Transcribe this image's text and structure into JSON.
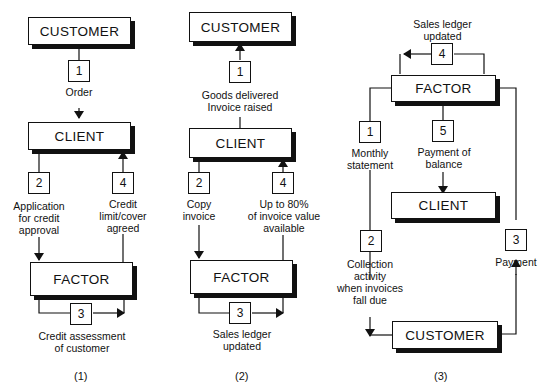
{
  "diagrams": [
    {
      "caption": "(1)",
      "entities": {
        "top": "CUSTOMER",
        "middle": "CLIENT",
        "bottom": "FACTOR"
      },
      "steps": [
        {
          "num": "1",
          "text": [
            "Order"
          ]
        },
        {
          "num": "2",
          "text": [
            "Application",
            "for credit",
            "approval"
          ]
        },
        {
          "num": "3",
          "text": [
            "Credit assessment",
            "of customer"
          ]
        },
        {
          "num": "4",
          "text": [
            "Credit",
            "limit/cover",
            "agreed"
          ]
        }
      ]
    },
    {
      "caption": "(2)",
      "entities": {
        "top": "CUSTOMER",
        "middle": "CLIENT",
        "bottom": "FACTOR"
      },
      "steps": [
        {
          "num": "1",
          "text": [
            "Goods delivered",
            "Invoice raised"
          ]
        },
        {
          "num": "2",
          "text": [
            "Copy",
            "invoice"
          ]
        },
        {
          "num": "3",
          "text": [
            "Sales ledger",
            "updated"
          ]
        },
        {
          "num": "4",
          "text": [
            "Up to 80%",
            "of invoice value",
            "available"
          ]
        }
      ]
    },
    {
      "caption": "(3)",
      "entities": {
        "top": "FACTOR",
        "middle": "CLIENT",
        "bottom": "CUSTOMER"
      },
      "steps": [
        {
          "num": "1",
          "text": [
            "Monthly",
            "statement"
          ]
        },
        {
          "num": "2",
          "text": [
            "Collection",
            "activity",
            "when invoices",
            "fall due"
          ]
        },
        {
          "num": "3",
          "text": [
            "Payment"
          ]
        },
        {
          "num": "4",
          "text": [
            "Sales ledger",
            "updated"
          ]
        },
        {
          "num": "5",
          "text": [
            "Payment of",
            "balance"
          ]
        }
      ]
    }
  ]
}
